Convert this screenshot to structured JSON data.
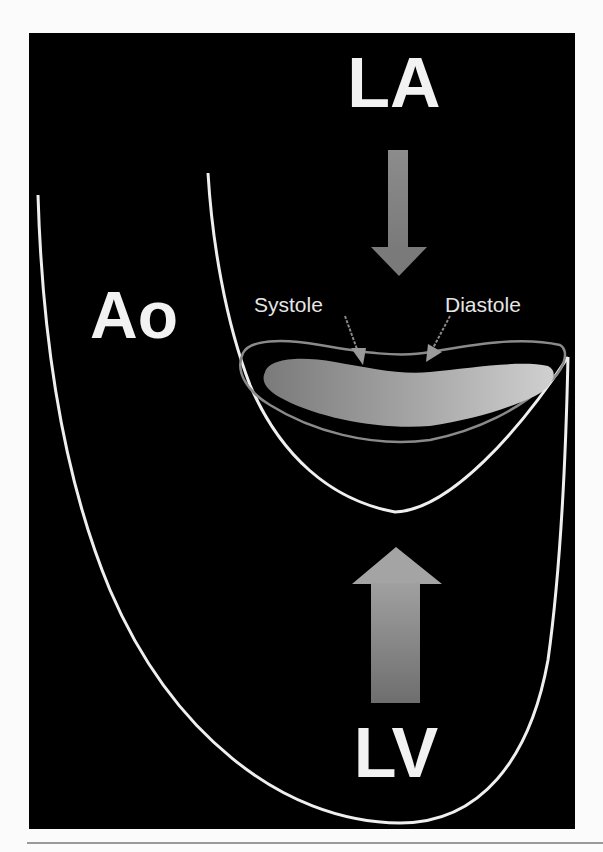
{
  "figure": {
    "background_color": "#000000",
    "line_color": "#f2f2f2",
    "accent_gray": "#8a8a8a",
    "labels": {
      "la": "LA",
      "ao": "Ao",
      "lv": "LV",
      "systole": "Systole",
      "diastole": "Diastole"
    },
    "arrows": [
      {
        "name": "inflow-arrow",
        "direction": "down",
        "from": "LA"
      },
      {
        "name": "outflow-arrow",
        "direction": "up",
        "from": "LV"
      }
    ],
    "annotations": [
      {
        "label": "Systole",
        "points_to": "systolic leaflet position"
      },
      {
        "label": "Diastole",
        "points_to": "diastolic leaflet position"
      }
    ]
  }
}
